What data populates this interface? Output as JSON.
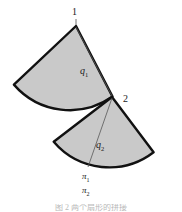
{
  "figure": {
    "background_color": "#ffffff",
    "sector_fill_color": "#c9c9c9",
    "sector_stroke_color": "#111111",
    "radius_line_color": "#555555",
    "label_color": "#1a1a1a"
  },
  "labels": {
    "vertex_1": "1",
    "vertex_2": "2",
    "radius_1_letter": "q",
    "radius_1_sub": "1",
    "radius_2_letter": "q",
    "radius_2_sub": "2",
    "angle_1_letter": "π",
    "angle_1_sub": "1",
    "angle_2_letter": "π",
    "angle_2_sub": "2"
  },
  "caption": {
    "text": "图 2   两个扇形的拼接"
  },
  "geometry": {
    "sector_1": {
      "apex_x": 76,
      "apex_y": 26,
      "radius": 74,
      "start_angle_deg": 135,
      "end_angle_deg": 205,
      "fill": "#c9c9c9"
    },
    "sector_2": {
      "apex_x": 112,
      "apex_y": 97,
      "radius": 73,
      "start_angle_deg": 143,
      "end_angle_deg": 215,
      "fill": "#c9c9c9"
    }
  }
}
